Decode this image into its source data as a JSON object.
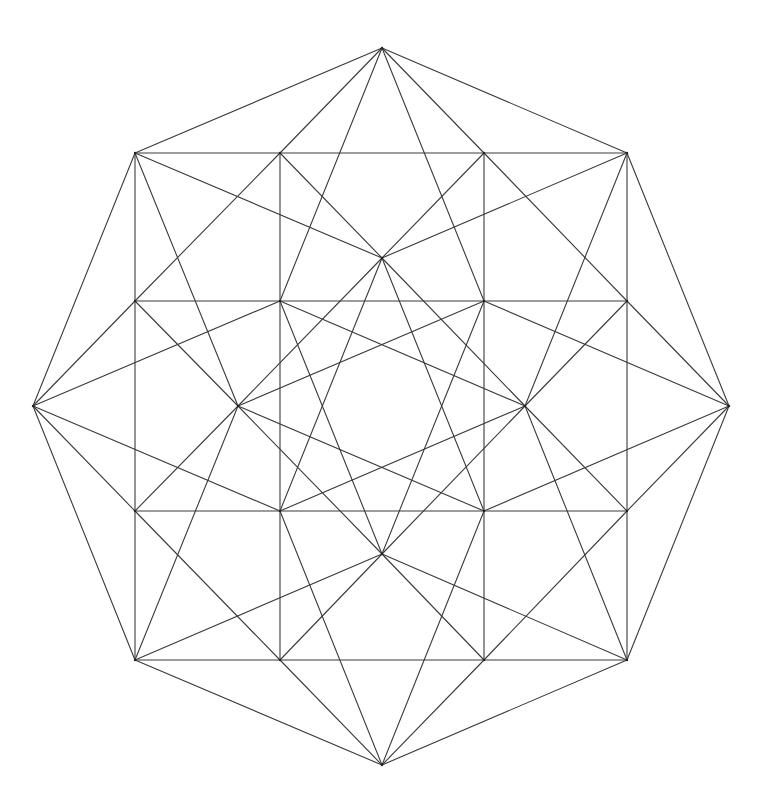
{
  "diagram": {
    "stroke_color": "#3a3a3a",
    "background": "#ffffff",
    "vertices": {
      "T": [
        382,
        48
      ],
      "R": [
        729,
        406
      ],
      "B": [
        382,
        765
      ],
      "L": [
        33,
        406
      ],
      "C1": [
        135,
        153
      ],
      "C2": [
        627,
        153
      ],
      "C3": [
        627,
        660
      ],
      "C4": [
        135,
        660
      ],
      "e1": [
        280,
        153
      ],
      "e2": [
        484,
        153
      ],
      "e3": [
        627,
        301
      ],
      "e4": [
        627,
        511
      ],
      "e5": [
        484,
        660
      ],
      "e6": [
        280,
        660
      ],
      "e7": [
        135,
        511
      ],
      "e8": [
        135,
        301
      ],
      "s1": [
        280,
        301
      ],
      "s2": [
        484,
        301
      ],
      "s3": [
        484,
        511
      ],
      "s4": [
        280,
        511
      ],
      "iT": [
        382,
        258
      ],
      "iR": [
        525,
        406
      ],
      "iB": [
        382,
        554
      ],
      "iL": [
        238,
        406
      ]
    },
    "edges": [
      [
        "T",
        "C1"
      ],
      [
        "T",
        "C2"
      ],
      [
        "R",
        "C2"
      ],
      [
        "R",
        "C3"
      ],
      [
        "B",
        "C3"
      ],
      [
        "B",
        "C4"
      ],
      [
        "L",
        "C4"
      ],
      [
        "L",
        "C1"
      ],
      [
        "T",
        "e1"
      ],
      [
        "T",
        "e2"
      ],
      [
        "R",
        "e3"
      ],
      [
        "R",
        "e4"
      ],
      [
        "B",
        "e5"
      ],
      [
        "B",
        "e6"
      ],
      [
        "L",
        "e7"
      ],
      [
        "L",
        "e8"
      ],
      [
        "T",
        "s1"
      ],
      [
        "T",
        "s2"
      ],
      [
        "R",
        "s2"
      ],
      [
        "R",
        "s3"
      ],
      [
        "B",
        "s3"
      ],
      [
        "B",
        "s4"
      ],
      [
        "L",
        "s4"
      ],
      [
        "L",
        "s1"
      ],
      [
        "C1",
        "e1"
      ],
      [
        "C2",
        "e2"
      ],
      [
        "C2",
        "e3"
      ],
      [
        "C3",
        "e4"
      ],
      [
        "C3",
        "e5"
      ],
      [
        "C4",
        "e6"
      ],
      [
        "C4",
        "e7"
      ],
      [
        "C1",
        "e8"
      ],
      [
        "C1",
        "iT"
      ],
      [
        "C2",
        "iT"
      ],
      [
        "C2",
        "iR"
      ],
      [
        "C3",
        "iR"
      ],
      [
        "C3",
        "iB"
      ],
      [
        "C4",
        "iB"
      ],
      [
        "C4",
        "iL"
      ],
      [
        "C1",
        "iL"
      ],
      [
        "e1",
        "e2"
      ],
      [
        "e3",
        "e4"
      ],
      [
        "e5",
        "e6"
      ],
      [
        "e7",
        "e8"
      ],
      [
        "e1",
        "s1"
      ],
      [
        "e2",
        "s2"
      ],
      [
        "e3",
        "s2"
      ],
      [
        "e4",
        "s3"
      ],
      [
        "e5",
        "s3"
      ],
      [
        "e6",
        "s4"
      ],
      [
        "e7",
        "s4"
      ],
      [
        "e8",
        "s1"
      ],
      [
        "e1",
        "iT"
      ],
      [
        "e2",
        "iT"
      ],
      [
        "e3",
        "iR"
      ],
      [
        "e4",
        "iR"
      ],
      [
        "e5",
        "iB"
      ],
      [
        "e6",
        "iB"
      ],
      [
        "e7",
        "iL"
      ],
      [
        "e8",
        "iL"
      ],
      [
        "e1",
        "e8"
      ],
      [
        "e2",
        "e3"
      ],
      [
        "e4",
        "e5"
      ],
      [
        "e6",
        "e7"
      ],
      [
        "s1",
        "s2"
      ],
      [
        "s2",
        "s3"
      ],
      [
        "s3",
        "s4"
      ],
      [
        "s4",
        "s1"
      ],
      [
        "s1",
        "iR"
      ],
      [
        "s2",
        "iB"
      ],
      [
        "s3",
        "iL"
      ],
      [
        "s4",
        "iT"
      ],
      [
        "s2",
        "iL"
      ],
      [
        "s1",
        "iB"
      ],
      [
        "s4",
        "iR"
      ],
      [
        "s3",
        "iT"
      ],
      [
        "iT",
        "iR"
      ],
      [
        "iR",
        "iB"
      ],
      [
        "iB",
        "iL"
      ],
      [
        "iL",
        "iT"
      ]
    ]
  }
}
